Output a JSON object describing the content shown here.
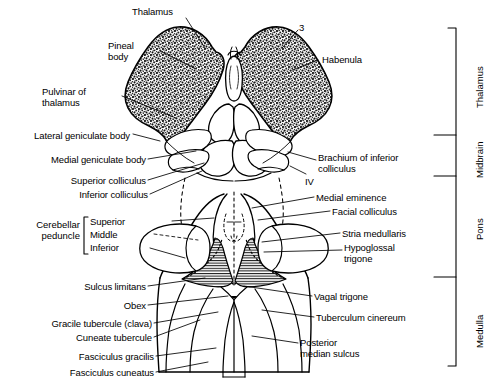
{
  "figure": {
    "ink_color": "#000000",
    "background_color": "#ffffff"
  },
  "labels_left": [
    {
      "id": "thalamus",
      "text": "Thalamus",
      "x": 132,
      "y": 6,
      "w": 70,
      "align": "left"
    },
    {
      "id": "pineal-body",
      "text": "Pineal\nbody",
      "x": 108,
      "y": 40,
      "w": 50,
      "align": "left"
    },
    {
      "id": "pulvinar-of-thalamus",
      "text": "Pulvinar of\nthalamus",
      "x": 42,
      "y": 86,
      "w": 78,
      "align": "left"
    },
    {
      "id": "lateral-geniculate-body",
      "text": "Lateral geniculate body",
      "x": 8,
      "y": 130,
      "w": 122,
      "align": "right"
    },
    {
      "id": "medial-geniculate-body",
      "text": "Medial geniculate body",
      "x": 24,
      "y": 154,
      "w": 122,
      "align": "right"
    },
    {
      "id": "superior-colliculus",
      "text": "Superior colliculus",
      "x": 42,
      "y": 175,
      "w": 104,
      "align": "right"
    },
    {
      "id": "inferior-colliculus",
      "text": "Inferior colliculus",
      "x": 50,
      "y": 189,
      "w": 98,
      "align": "right"
    },
    {
      "id": "sulcus-limitans",
      "text": "Sulcus limitans",
      "x": 58,
      "y": 281,
      "w": 88,
      "align": "right"
    },
    {
      "id": "obex",
      "text": "Obex",
      "x": 96,
      "y": 300,
      "w": 50,
      "align": "right"
    },
    {
      "id": "gracile-tubercule",
      "text": "Gracile tubercule (clava)",
      "x": 16,
      "y": 318,
      "w": 136,
      "align": "right"
    },
    {
      "id": "cuneate-tubercule",
      "text": "Cuneate tubercule",
      "x": 40,
      "y": 332,
      "w": 112,
      "align": "right"
    },
    {
      "id": "fasciculus-gracilis",
      "text": "Fasciculus gracilis",
      "x": 56,
      "y": 351,
      "w": 98,
      "align": "right"
    },
    {
      "id": "fasciculus-cuneatus",
      "text": "Fasciculus cuneatus",
      "x": 48,
      "y": 367,
      "w": 106,
      "align": "right"
    }
  ],
  "labels_right": [
    {
      "id": "three",
      "text": "3",
      "x": 299,
      "y": 22,
      "w": 14,
      "align": "left"
    },
    {
      "id": "habenula",
      "text": "Habenula",
      "x": 322,
      "y": 54,
      "w": 60,
      "align": "left"
    },
    {
      "id": "brachium-inferior-colliculus",
      "text": "Brachium of inferior\ncolliculus",
      "x": 318,
      "y": 152,
      "w": 116,
      "align": "left"
    },
    {
      "id": "nerve-four",
      "text": "IV",
      "x": 305,
      "y": 176,
      "w": 18,
      "align": "left"
    },
    {
      "id": "medial-eminence",
      "text": "Medial eminence",
      "x": 316,
      "y": 192,
      "w": 100,
      "align": "left"
    },
    {
      "id": "facial-colliculus",
      "text": "Facial colliculus",
      "x": 332,
      "y": 206,
      "w": 94,
      "align": "left"
    },
    {
      "id": "stria-medullaris",
      "text": "Stria medullaris",
      "x": 342,
      "y": 228,
      "w": 92,
      "align": "left"
    },
    {
      "id": "hypoglossal-trigone",
      "text": "Hypoglossal\ntrigone",
      "x": 344,
      "y": 242,
      "w": 78,
      "align": "left"
    },
    {
      "id": "vagal-trigone",
      "text": "Vagal trigone",
      "x": 314,
      "y": 291,
      "w": 84,
      "align": "left"
    },
    {
      "id": "tuberculum-cinereum",
      "text": "Tuberculum cinereum",
      "x": 316,
      "y": 312,
      "w": 124,
      "align": "left"
    },
    {
      "id": "posterior-median-sulcus",
      "text": "Posterior\nmedian sulcus",
      "x": 300,
      "y": 337,
      "w": 96,
      "align": "left"
    }
  ],
  "peduncle_group": {
    "id": "cerebellar-peduncle",
    "title": "Cerebellar\npeduncle",
    "title_x": 8,
    "title_y": 219,
    "title_w": 72,
    "bracket_x": 84,
    "bracket_top": 217,
    "bracket_bottom": 254,
    "items": [
      {
        "id": "superior-peduncle",
        "text": "Superior",
        "x": 90,
        "y": 216
      },
      {
        "id": "middle-peduncle",
        "text": "Middle",
        "x": 90,
        "y": 229
      },
      {
        "id": "inferior-peduncle",
        "text": "Inferior",
        "x": 90,
        "y": 242
      }
    ]
  },
  "regions": {
    "bracket_x": 456,
    "tick_x_start": 434,
    "top": 28,
    "bottom": 366,
    "divisions": [
      {
        "id": "thalamus-region",
        "text": "Thalamus",
        "top": 28,
        "bottom": 135
      },
      {
        "id": "midbrain-region",
        "text": "Midbrain",
        "top": 135,
        "bottom": 176
      },
      {
        "id": "pons-region",
        "text": "Pons",
        "top": 176,
        "bottom": 277
      },
      {
        "id": "medulla-region",
        "text": "Medulla",
        "top": 277,
        "bottom": 366
      }
    ]
  }
}
